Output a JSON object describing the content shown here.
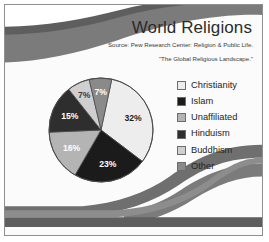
{
  "slide": {
    "title": "World Religions",
    "source_line_1": "Source: Pew Research Center: Religion & Public Life.",
    "source_line_2": "\"The Global Religious Landscape.\""
  },
  "theme": {
    "background": "#fbfbfb",
    "wave_dark": "#5e5e5e",
    "wave_mid": "#7b7b7b",
    "wave_light": "#9a9a9a",
    "frame_border": "#8f8f8f",
    "title_color": "#2b2b2b",
    "source_color": "#3a3a3a",
    "legend_text_color": "#242424",
    "swatch_border": "#6d6d6d",
    "pie_outline": "#4a4a4a"
  },
  "chart_data": {
    "type": "pie",
    "title": "World Religions",
    "subtitle": "Source: Pew Research Center: Religion & Public Life. \"The Global Religious Landscape.\"",
    "legend_position": "right",
    "grid": false,
    "units": "percent",
    "categories": [
      "Christianity",
      "Islam",
      "Unaffiliated",
      "Hinduism",
      "Buddhism",
      "Other"
    ],
    "values": [
      32,
      23,
      16,
      15,
      7,
      7
    ],
    "data_labels": [
      "32%",
      "23%",
      "16%",
      "15%",
      "7%",
      "7%"
    ],
    "colors": [
      "#ededed",
      "#1b1b1b",
      "#b4b4b4",
      "#2e2e2e",
      "#cfcfcf",
      "#8a8a8a"
    ],
    "label_colors": [
      "#1f1f1f",
      "#ffffff",
      "#ffffff",
      "#ffffff",
      "#3b3b3b",
      "#ffffff"
    ],
    "slices": [
      {
        "name": "Christianity",
        "value": 32,
        "label": "32%",
        "color": "#ededed",
        "label_color": "#1f1f1f",
        "label_x": 84,
        "label_y": 61
      },
      {
        "name": "Islam",
        "value": 23,
        "label": "23%",
        "color": "#1b1b1b",
        "label_color": "#ffffff",
        "label_x": 63,
        "label_y": 96
      },
      {
        "name": "Unaffiliated",
        "value": 16,
        "label": "16%",
        "color": "#b4b4b4",
        "label_color": "#ffffff",
        "label_x": 28,
        "label_y": 79
      },
      {
        "name": "Hinduism",
        "value": 15,
        "label": "15%",
        "color": "#2e2e2e",
        "label_color": "#ffffff",
        "label_x": 23,
        "label_y": 41
      },
      {
        "name": "Buddhism",
        "value": 7,
        "label": "7%",
        "color": "#cfcfcf",
        "label_color": "#3b3b3b",
        "label_x": 38,
        "label_y": 18
      },
      {
        "name": "Other",
        "value": 7,
        "label": "7%",
        "color": "#8a8a8a",
        "label_color": "#ffffff",
        "label_x": 57,
        "label_y": 15
      }
    ]
  },
  "legend": {
    "items": [
      {
        "label": "Christianity",
        "color": "#ededed"
      },
      {
        "label": "Islam",
        "color": "#1b1b1b"
      },
      {
        "label": "Unaffiliated",
        "color": "#b4b4b4"
      },
      {
        "label": "Hinduism",
        "color": "#2e2e2e"
      },
      {
        "label": "Buddhism",
        "color": "#cfcfcf"
      },
      {
        "label": "Other",
        "color": "#8a8a8a"
      }
    ]
  }
}
